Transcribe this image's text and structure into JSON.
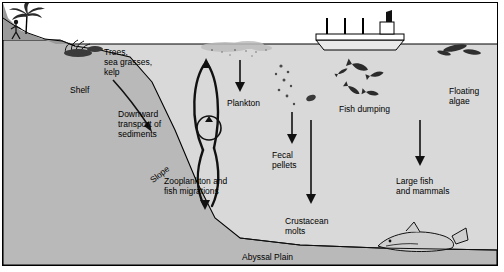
{
  "diagram": {
    "background": "#ffffff",
    "colors": {
      "sea": "#d9d9d9",
      "seafloor": "#b3b3b3",
      "line": "#000000",
      "land": "#9a9a9a"
    },
    "labels": [
      {
        "id": "trees",
        "text": "Trees,\nsea grasses,\nkelp",
        "x": 104,
        "y": 47,
        "align": "left"
      },
      {
        "id": "shelf",
        "text": "Shelf",
        "x": 70,
        "y": 85,
        "align": "left"
      },
      {
        "id": "downward",
        "text": "Downward\ntransport of\nsediments",
        "x": 118,
        "y": 109,
        "align": "left"
      },
      {
        "id": "slope",
        "text": "Slope",
        "x": 148,
        "y": 177,
        "align": "left"
      },
      {
        "id": "plankton",
        "text": "Plankton",
        "x": 227,
        "y": 98,
        "align": "left"
      },
      {
        "id": "zooplankton",
        "text": "Zooplankton and\nfish migrations",
        "x": 164,
        "y": 176,
        "align": "left"
      },
      {
        "id": "fecal",
        "text": "Fecal\npellets",
        "x": 272,
        "y": 150,
        "align": "left"
      },
      {
        "id": "crustacean",
        "text": "Crustacean\nmolts",
        "x": 285,
        "y": 216,
        "align": "left"
      },
      {
        "id": "fishdumping",
        "text": "Fish dumping",
        "x": 339,
        "y": 104,
        "align": "left"
      },
      {
        "id": "largefish",
        "text": "Large fish\nand mammals",
        "x": 396,
        "y": 176,
        "align": "left"
      },
      {
        "id": "floating",
        "text": "Floating\nalgae",
        "x": 449,
        "y": 86,
        "align": "left"
      },
      {
        "id": "abyssal",
        "text": "Abyssal Plain",
        "x": 242,
        "y": 252,
        "align": "left"
      }
    ]
  }
}
